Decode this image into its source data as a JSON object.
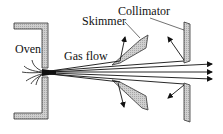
{
  "diagram": {
    "labels": {
      "oven": "Oven",
      "gas_flow": "Gas flow",
      "skimmer": "Skimmer",
      "collimator": "Collimator"
    },
    "colors": {
      "wall_fill": "#c8c8c8",
      "stroke": "#111111",
      "background": "#ffffff"
    }
  }
}
